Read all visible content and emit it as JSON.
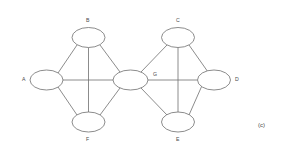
{
  "figure": {
    "caption": "(c)",
    "caption_x": 258,
    "caption_y": 122,
    "width": 282,
    "height": 154,
    "background_color": "#ffffff",
    "stroke_color": "#6f6f6f",
    "label_color": "#4a4a4a"
  },
  "graph": {
    "type": "undirected-node-link",
    "node_shape": "ellipse",
    "nodes": [
      {
        "id": "A",
        "label": "A",
        "cx": 46.5,
        "cy": 80,
        "rx": 16.5,
        "ry": 10,
        "label_x": 22,
        "label_y": 77
      },
      {
        "id": "B",
        "label": "B",
        "cx": 88.5,
        "cy": 37.5,
        "rx": 16.5,
        "ry": 10,
        "label_x": 86,
        "label_y": 18
      },
      {
        "id": "C",
        "label": "C",
        "cx": 178,
        "cy": 37.5,
        "rx": 16.5,
        "ry": 10,
        "label_x": 176,
        "label_y": 18
      },
      {
        "id": "D",
        "label": "D",
        "cx": 214,
        "cy": 80,
        "rx": 16.5,
        "ry": 10,
        "label_x": 235,
        "label_y": 77
      },
      {
        "id": "E",
        "label": "E",
        "cx": 178,
        "cy": 122,
        "rx": 16.5,
        "ry": 10,
        "label_x": 176,
        "label_y": 137
      },
      {
        "id": "F",
        "label": "F",
        "cx": 88.5,
        "cy": 122,
        "rx": 16.5,
        "ry": 10,
        "label_x": 86,
        "label_y": 137
      },
      {
        "id": "G",
        "label": "G",
        "cx": 130.5,
        "cy": 80,
        "rx": 17.5,
        "ry": 10,
        "label_x": 153,
        "label_y": 72
      }
    ],
    "edges": [
      {
        "source": "A",
        "target": "B",
        "x1": 58,
        "y1": 73,
        "x2": 77,
        "y2": 45
      },
      {
        "source": "A",
        "target": "F",
        "x1": 58,
        "y1": 87,
        "x2": 77,
        "y2": 115
      },
      {
        "source": "A",
        "target": "G",
        "x1": 63,
        "y1": 80,
        "x2": 113,
        "y2": 80
      },
      {
        "source": "B",
        "target": "F",
        "x1": 88.5,
        "y1": 47.5,
        "x2": 88.5,
        "y2": 112
      },
      {
        "source": "B",
        "target": "G",
        "x1": 100,
        "y1": 45,
        "x2": 120,
        "y2": 72
      },
      {
        "source": "F",
        "target": "G",
        "x1": 100,
        "y1": 115,
        "x2": 120,
        "y2": 88
      },
      {
        "source": "G",
        "target": "C",
        "x1": 141,
        "y1": 72,
        "x2": 167,
        "y2": 45
      },
      {
        "source": "G",
        "target": "E",
        "x1": 141,
        "y1": 88,
        "x2": 167,
        "y2": 115
      },
      {
        "source": "G",
        "target": "D",
        "x1": 148,
        "y1": 80,
        "x2": 197.5,
        "y2": 80
      },
      {
        "source": "C",
        "target": "E",
        "x1": 178,
        "y1": 47.5,
        "x2": 178,
        "y2": 112
      },
      {
        "source": "C",
        "target": "D",
        "x1": 189,
        "y1": 45,
        "x2": 208,
        "y2": 72
      },
      {
        "source": "E",
        "target": "D",
        "x1": 189,
        "y1": 115,
        "x2": 208,
        "y2": 72
      }
    ]
  }
}
